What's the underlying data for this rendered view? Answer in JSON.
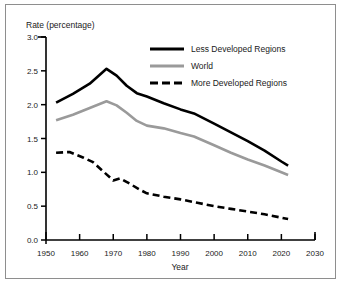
{
  "chart_data": {
    "type": "line",
    "title": "",
    "xlabel": "Year",
    "ylabel": "Rate (percentage)",
    "xlim": [
      1950,
      2030
    ],
    "ylim": [
      0.0,
      3.0
    ],
    "xticks": [
      1950,
      1960,
      1970,
      1980,
      1990,
      2000,
      2010,
      2020,
      2030
    ],
    "xtick_labels": [
      "1950",
      "1960",
      "1970",
      "1980",
      "1990",
      "2000",
      "2010",
      "2020",
      "2030"
    ],
    "yticks": [
      0.0,
      0.5,
      1.0,
      1.5,
      2.0,
      2.5,
      3.0
    ],
    "ytick_labels": [
      "0.0",
      "0.5",
      "1.0",
      "1.5",
      "2.0",
      "2.5",
      "3.0"
    ],
    "grid": false,
    "legend_position": "upper-center",
    "series": [
      {
        "name": "Less Developed Regions",
        "color": "#000000",
        "style": "solid",
        "width": 2.6,
        "x": [
          1953,
          1958,
          1963,
          1968,
          1971,
          1974,
          1977,
          1980,
          1985,
          1990,
          1994,
          2000,
          2005,
          2010,
          2015,
          2020,
          2022
        ],
        "values": [
          2.03,
          2.16,
          2.31,
          2.53,
          2.43,
          2.28,
          2.17,
          2.12,
          2.02,
          1.93,
          1.87,
          1.72,
          1.59,
          1.46,
          1.32,
          1.16,
          1.1
        ]
      },
      {
        "name": "World",
        "color": "#9a9a9a",
        "style": "solid",
        "width": 2.6,
        "x": [
          1953,
          1958,
          1963,
          1968,
          1971,
          1974,
          1977,
          1980,
          1985,
          1990,
          1994,
          2000,
          2005,
          2010,
          2015,
          2020,
          2022
        ],
        "values": [
          1.77,
          1.85,
          1.95,
          2.05,
          1.99,
          1.88,
          1.76,
          1.69,
          1.65,
          1.58,
          1.53,
          1.4,
          1.29,
          1.19,
          1.1,
          1.0,
          0.96
        ]
      },
      {
        "name": "More Developed Regions",
        "color": "#000000",
        "style": "dashed",
        "width": 2.6,
        "x": [
          1953,
          1957,
          1961,
          1964,
          1968,
          1970,
          1972,
          1975,
          1978,
          1980,
          1985,
          1990,
          1995,
          2000,
          2005,
          2010,
          2015,
          2020,
          2022
        ],
        "values": [
          1.29,
          1.3,
          1.22,
          1.15,
          0.97,
          0.88,
          0.91,
          0.83,
          0.74,
          0.69,
          0.64,
          0.6,
          0.55,
          0.5,
          0.46,
          0.42,
          0.38,
          0.33,
          0.31
        ]
      }
    ],
    "legend_entries": [
      {
        "label": "Less Developed Regions",
        "color": "#000000",
        "style": "solid"
      },
      {
        "label": "World",
        "color": "#9a9a9a",
        "style": "solid"
      },
      {
        "label": "More Developed Regions",
        "color": "#000000",
        "style": "dashed"
      }
    ]
  },
  "colors": {
    "frame": "#8e8e8e",
    "axis": "#000000",
    "text": "#1a1a1a",
    "background": "#ffffff"
  }
}
